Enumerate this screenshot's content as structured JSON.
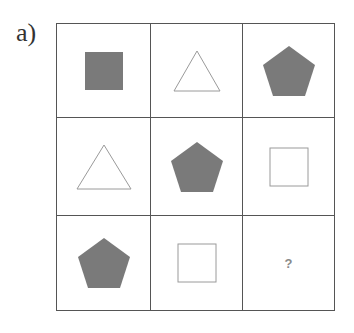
{
  "label": "a)",
  "colors": {
    "fill": "#7a7a7a",
    "outline": "#9a9a9a",
    "grid": "#555555"
  },
  "grid": {
    "rows": 3,
    "cols": 3,
    "cells": [
      {
        "row": 1,
        "col": 1,
        "shape": "square",
        "style": "filled"
      },
      {
        "row": 1,
        "col": 2,
        "shape": "triangle",
        "style": "outline"
      },
      {
        "row": 1,
        "col": 3,
        "shape": "pentagon",
        "style": "filled"
      },
      {
        "row": 2,
        "col": 1,
        "shape": "triangle",
        "style": "outline"
      },
      {
        "row": 2,
        "col": 2,
        "shape": "pentagon",
        "style": "filled"
      },
      {
        "row": 2,
        "col": 3,
        "shape": "square",
        "style": "outline"
      },
      {
        "row": 3,
        "col": 1,
        "shape": "pentagon",
        "style": "filled"
      },
      {
        "row": 3,
        "col": 2,
        "shape": "square",
        "style": "outline"
      },
      {
        "row": 3,
        "col": 3,
        "shape": "unknown",
        "text": "?"
      }
    ]
  }
}
